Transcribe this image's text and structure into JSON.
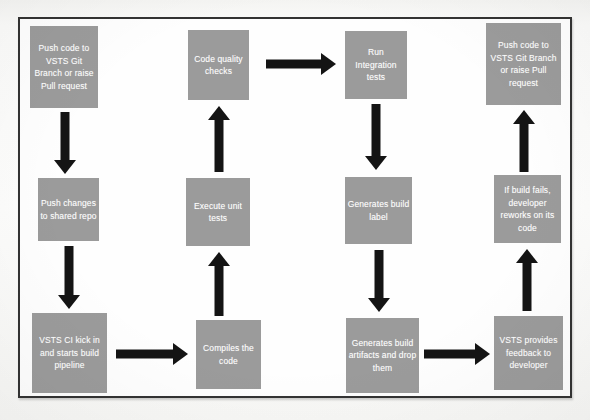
{
  "diagram": {
    "colors": {
      "node_fill": "#9b9b9b",
      "node_text": "#ffffff",
      "arrow": "#141414",
      "frame_border": "#333333",
      "background": "#fdfdfd"
    },
    "nodes": [
      {
        "id": "push-code-left",
        "label": "Push code to VSTS Git Branch or raise Pull request",
        "x": 30,
        "y": 26,
        "w": 68,
        "h": 82
      },
      {
        "id": "code-quality-checks",
        "label": "Code quality checks",
        "x": 188,
        "y": 30,
        "w": 61,
        "h": 70
      },
      {
        "id": "run-integration-tests",
        "label": "Run Integration tests",
        "x": 345,
        "y": 31,
        "w": 62,
        "h": 68
      },
      {
        "id": "push-code-right",
        "label": "Push code to VSTS Git Branch or raise Pull request",
        "x": 486,
        "y": 23,
        "w": 75,
        "h": 82
      },
      {
        "id": "push-changes-repo",
        "label": "Push changes to shared repo",
        "x": 38,
        "y": 178,
        "w": 61,
        "h": 63
      },
      {
        "id": "execute-unit-tests",
        "label": "Execute unit tests",
        "x": 186,
        "y": 178,
        "w": 64,
        "h": 68
      },
      {
        "id": "generates-build-label",
        "label": "Generates build label",
        "x": 345,
        "y": 177,
        "w": 67,
        "h": 67
      },
      {
        "id": "build-fails-rework",
        "label": "If build fails, developer reworks on its code",
        "x": 494,
        "y": 175,
        "w": 67,
        "h": 68
      },
      {
        "id": "vsts-ci-kick-in",
        "label": "VSTS CI kick in and starts build pipeline",
        "x": 32,
        "y": 313,
        "w": 75,
        "h": 80
      },
      {
        "id": "compiles-the-code",
        "label": "Compiles the code",
        "x": 196,
        "y": 320,
        "w": 65,
        "h": 69
      },
      {
        "id": "generates-artifacts",
        "label": "Generates build artifacts and drop them",
        "x": 346,
        "y": 318,
        "w": 73,
        "h": 75
      },
      {
        "id": "vsts-provides-feedback",
        "label": "VSTS provides feedback to developer",
        "x": 494,
        "y": 316,
        "w": 69,
        "h": 74
      }
    ],
    "arrows": [
      {
        "id": "arrow-push-code-to-push-changes",
        "direction": "down",
        "from": "push-code-left",
        "to": "push-changes-repo",
        "x": 52,
        "y": 112,
        "w": 26,
        "h": 62
      },
      {
        "id": "arrow-push-changes-to-vsts-ci",
        "direction": "down",
        "from": "push-changes-repo",
        "to": "vsts-ci-kick-in",
        "x": 56,
        "y": 246,
        "w": 26,
        "h": 63
      },
      {
        "id": "arrow-vsts-ci-to-compiles",
        "direction": "right",
        "from": "vsts-ci-kick-in",
        "to": "compiles-the-code",
        "x": 116,
        "y": 342,
        "w": 72,
        "h": 24
      },
      {
        "id": "arrow-compiles-to-execute-unit-tests",
        "direction": "up",
        "from": "compiles-the-code",
        "to": "execute-unit-tests",
        "x": 206,
        "y": 252,
        "w": 26,
        "h": 64
      },
      {
        "id": "arrow-execute-unit-tests-to-quality",
        "direction": "up",
        "from": "execute-unit-tests",
        "to": "code-quality-checks",
        "x": 206,
        "y": 106,
        "w": 26,
        "h": 66
      },
      {
        "id": "arrow-quality-to-run-integration",
        "direction": "right",
        "from": "code-quality-checks",
        "to": "run-integration-tests",
        "x": 266,
        "y": 52,
        "w": 70,
        "h": 24
      },
      {
        "id": "arrow-run-integration-to-build-label",
        "direction": "down",
        "from": "run-integration-tests",
        "to": "generates-build-label",
        "x": 363,
        "y": 104,
        "w": 26,
        "h": 66
      },
      {
        "id": "arrow-build-label-to-artifacts",
        "direction": "down",
        "from": "generates-build-label",
        "to": "generates-artifacts",
        "x": 366,
        "y": 250,
        "w": 26,
        "h": 62
      },
      {
        "id": "arrow-artifacts-to-feedback",
        "direction": "right",
        "from": "generates-artifacts",
        "to": "vsts-provides-feedback",
        "x": 424,
        "y": 342,
        "w": 66,
        "h": 24
      },
      {
        "id": "arrow-feedback-to-build-fails",
        "direction": "up",
        "from": "vsts-provides-feedback",
        "to": "build-fails-rework",
        "x": 514,
        "y": 249,
        "w": 26,
        "h": 62
      },
      {
        "id": "arrow-build-fails-to-push-code-right",
        "direction": "up",
        "from": "build-fails-rework",
        "to": "push-code-right",
        "x": 511,
        "y": 110,
        "w": 26,
        "h": 62
      }
    ]
  }
}
